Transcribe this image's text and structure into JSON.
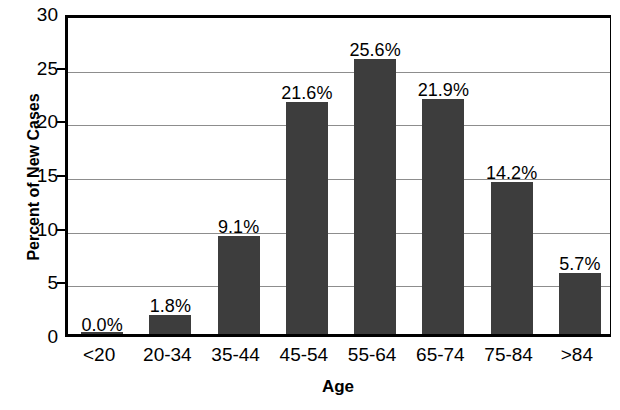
{
  "chart_data": {
    "type": "bar",
    "title": "",
    "subtitle": "",
    "xlabel": "Age",
    "ylabel": "Percent of New Cases",
    "categories": [
      "<20",
      "20-34",
      "35-44",
      "45-54",
      "55-64",
      "65-74",
      "75-84",
      ">84"
    ],
    "values": [
      0.0,
      1.8,
      9.1,
      21.6,
      25.6,
      21.9,
      14.2,
      5.7
    ],
    "data_labels": [
      "0.0%",
      "1.8%",
      "9.1%",
      "21.6%",
      "25.6%",
      "21.9%",
      "14.2%",
      "5.7%"
    ],
    "ylim": [
      0,
      30
    ],
    "yticks": [
      0,
      5,
      10,
      15,
      20,
      25,
      30
    ],
    "ytick_labels": [
      "0",
      "5",
      "10",
      "15",
      "20",
      "25",
      "30"
    ],
    "grid": "horizontal",
    "legend": "none",
    "bar_color": "#3d3d3d",
    "axis_color": "#000000",
    "gridline_color": "#8d8d8d",
    "background": "#ffffff"
  }
}
